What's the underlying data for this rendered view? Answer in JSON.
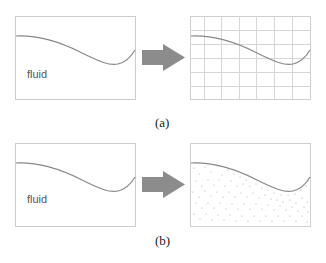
{
  "diagram": {
    "panels": [
      {
        "id": "a",
        "caption": "(a)",
        "left_box": {
          "label": "fluid"
        },
        "right_box": {
          "style": "grid",
          "columns": 7,
          "rows": 6
        }
      },
      {
        "id": "b",
        "caption": "(b)",
        "left_box": {
          "label": "fluid"
        },
        "right_box": {
          "style": "particles"
        }
      }
    ],
    "arrow_icon": "right-arrow-icon",
    "colors": {
      "box_border": "#cccccc",
      "curve": "#888888",
      "grid": "#d0d0d0",
      "arrow": "#8c8c8c",
      "dots": "#aaaaaa"
    }
  }
}
